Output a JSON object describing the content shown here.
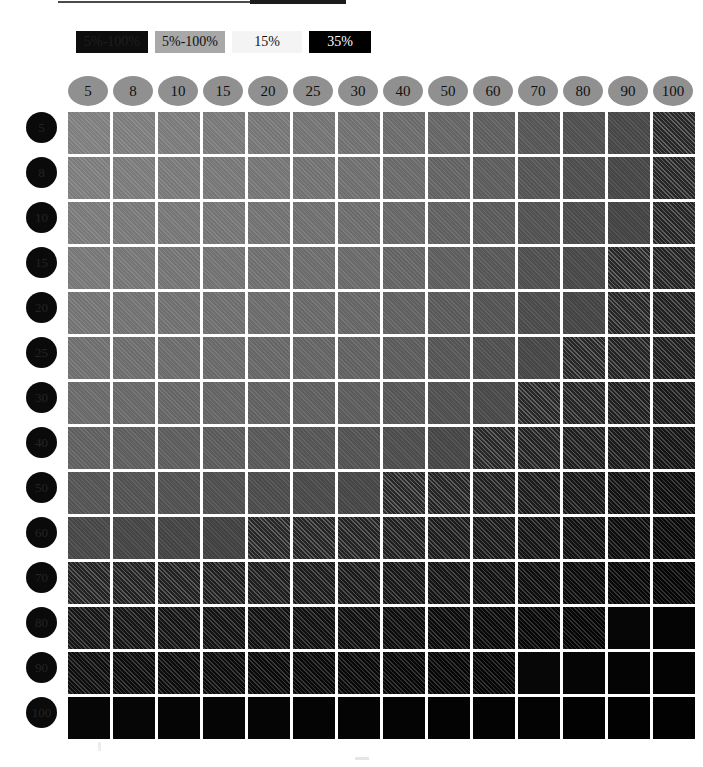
{
  "legend": {
    "items": [
      {
        "label": "5%-100%",
        "bg": "#0d0d0d",
        "fg": "#1e1e1e"
      },
      {
        "label": "5%-100%",
        "bg": "#a8a8a8",
        "fg": "#101010"
      },
      {
        "label": "15%",
        "bg": "#f4f4f4",
        "fg": "#111111"
      },
      {
        "label": "35%",
        "bg": "#000000",
        "fg": "#ffffff"
      }
    ]
  },
  "chart_data": {
    "type": "heatmap",
    "title": "",
    "xlabel": "",
    "ylabel": "",
    "grid": false,
    "legend_position": "top-left",
    "columns": [
      "5",
      "8",
      "10",
      "15",
      "20",
      "25",
      "30",
      "40",
      "50",
      "60",
      "70",
      "80",
      "90",
      "100"
    ],
    "rows": [
      "5",
      "8",
      "10",
      "15",
      "20",
      "25",
      "30",
      "40",
      "50",
      "60",
      "70",
      "80",
      "90",
      "100"
    ],
    "colorscale": "grayscale-dark-high",
    "value_unit": "gray-level",
    "values": [
      [
        136,
        134,
        132,
        130,
        127,
        124,
        121,
        115,
        108,
        101,
        92,
        85,
        77,
        69
      ],
      [
        134,
        132,
        130,
        128,
        125,
        122,
        119,
        113,
        106,
        99,
        90,
        83,
        75,
        67
      ],
      [
        131,
        129,
        127,
        125,
        122,
        119,
        116,
        110,
        103,
        96,
        87,
        80,
        72,
        64
      ],
      [
        128,
        126,
        124,
        122,
        119,
        116,
        113,
        107,
        100,
        93,
        84,
        77,
        69,
        61
      ],
      [
        124,
        122,
        120,
        118,
        115,
        112,
        109,
        103,
        96,
        89,
        80,
        73,
        65,
        57
      ],
      [
        119,
        117,
        115,
        113,
        110,
        107,
        104,
        98,
        91,
        84,
        75,
        68,
        60,
        52
      ],
      [
        113,
        111,
        109,
        107,
        104,
        101,
        98,
        92,
        85,
        78,
        69,
        62,
        54,
        46
      ],
      [
        103,
        101,
        99,
        97,
        94,
        91,
        88,
        82,
        75,
        68,
        59,
        52,
        44,
        36
      ],
      [
        90,
        88,
        86,
        84,
        81,
        78,
        75,
        69,
        62,
        55,
        46,
        39,
        31,
        24
      ],
      [
        76,
        74,
        72,
        70,
        67,
        64,
        61,
        55,
        49,
        43,
        35,
        29,
        22,
        17
      ],
      [
        60,
        58,
        56,
        54,
        51,
        48,
        45,
        40,
        35,
        30,
        24,
        19,
        14,
        10
      ],
      [
        38,
        36,
        34,
        32,
        30,
        28,
        26,
        22,
        19,
        16,
        12,
        9,
        6,
        4
      ],
      [
        24,
        22,
        21,
        20,
        18,
        17,
        15,
        13,
        11,
        9,
        7,
        5,
        4,
        3
      ],
      [
        6,
        6,
        5,
        5,
        5,
        4,
        4,
        4,
        3,
        3,
        3,
        2,
        2,
        2
      ]
    ]
  }
}
